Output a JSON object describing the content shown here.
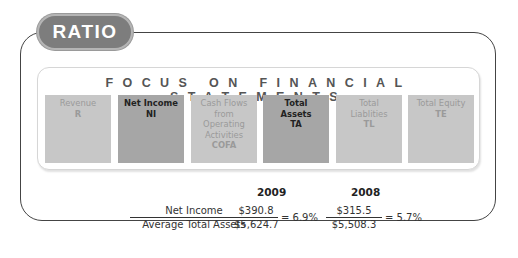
{
  "badge": {
    "label": "RATIO"
  },
  "panel": {
    "title": "FOCUS ON FINANCIAL STATEMENTS",
    "statements": [
      {
        "name": "Revenue",
        "abbr": "R",
        "highlighted": false
      },
      {
        "name": "Net Income",
        "abbr": "NI",
        "highlighted": true
      },
      {
        "name": "Cash Flows from Operating Activities",
        "abbr": "COFA",
        "highlighted": false
      },
      {
        "name": "Total Assets",
        "abbr": "TA",
        "highlighted": true
      },
      {
        "name": "Total Liablities",
        "abbr": "TL",
        "highlighted": false
      },
      {
        "name": "Total Equity",
        "abbr": "TE",
        "highlighted": false
      }
    ]
  },
  "formula": {
    "numerator": "Net Income",
    "denominator": "Average Total Assets",
    "years": [
      {
        "year": "2009",
        "numerator": "$390.8",
        "denominator": "$5,624.7",
        "result": "= 6.9%"
      },
      {
        "year": "2008",
        "numerator": "$315.5",
        "denominator": "$5,508.3",
        "result": "= 5.7%"
      }
    ]
  },
  "colors": {
    "badge": "#7d7d7d",
    "highlighted_box": "#a6a6a6",
    "dim_box": "#c7c7c7",
    "dim_text": "#9a9a9a"
  }
}
